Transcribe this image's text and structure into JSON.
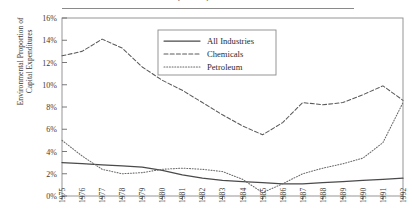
{
  "figure": {
    "clipped_title": "Capital Expenditures",
    "ylabel_line1": "Environmental Proportion of",
    "ylabel_line2": "Capital Expenditures"
  },
  "legend": {
    "entries": [
      {
        "label": "All Industries",
        "style": "solid"
      },
      {
        "label": "Chemicals",
        "style": "dashed"
      },
      {
        "label": "Petroleum",
        "style": "dotted"
      }
    ]
  },
  "chart_data": {
    "type": "line",
    "title": "Capital Expenditures",
    "xlabel": "",
    "ylabel": "Environmental Proportion of Capital Expenditures",
    "ylim": [
      0,
      16
    ],
    "yticks": [
      0,
      2,
      4,
      6,
      8,
      10,
      12,
      14,
      16
    ],
    "ytick_labels": [
      "0%",
      "2%",
      "4%",
      "6%",
      "8%",
      "10%",
      "12%",
      "14%",
      "16%"
    ],
    "grid": false,
    "legend_position": "upper-center",
    "x": [
      1975,
      1976,
      1977,
      1978,
      1979,
      1980,
      1981,
      1982,
      1983,
      1984,
      1985,
      1986,
      1987,
      1988,
      1989,
      1990,
      1991,
      1992
    ],
    "xtick_labels": [
      "1975",
      "1976",
      "1977",
      "1978",
      "1979",
      "1980",
      "1981",
      "1982",
      "1983",
      "1984",
      "1985",
      "1986",
      "1987",
      "1988",
      "1989",
      "1990",
      "1991",
      "1992"
    ],
    "series": [
      {
        "name": "All Industries",
        "style": "solid",
        "color": "#4a4a4a",
        "values": [
          3.0,
          2.9,
          2.8,
          2.7,
          2.6,
          2.3,
          1.9,
          1.6,
          1.4,
          1.3,
          1.2,
          1.1,
          1.1,
          1.2,
          1.3,
          1.4,
          1.5,
          1.6
        ]
      },
      {
        "name": "Chemicals",
        "style": "dashed",
        "color": "#5a5a5a",
        "values": [
          12.6,
          13.0,
          14.1,
          13.3,
          11.6,
          10.4,
          9.5,
          8.4,
          7.3,
          6.3,
          5.5,
          6.6,
          8.4,
          8.2,
          8.4,
          9.1,
          9.9,
          8.6
        ]
      },
      {
        "name": "Petroleum",
        "style": "dotted",
        "color": "#6a6a6a",
        "values": [
          5.0,
          3.6,
          2.4,
          2.0,
          2.1,
          2.4,
          2.5,
          2.4,
          2.2,
          1.5,
          0.3,
          1.1,
          2.0,
          2.5,
          2.9,
          3.4,
          4.8,
          8.4
        ]
      }
    ]
  }
}
